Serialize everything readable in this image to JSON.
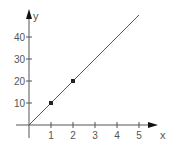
{
  "chart_data": {
    "type": "line",
    "title": "",
    "xlabel": "x",
    "ylabel": "y",
    "xlim": [
      0,
      5.4
    ],
    "ylim": [
      0,
      50
    ],
    "x_ticks": [
      1,
      2,
      3,
      4,
      5
    ],
    "y_ticks": [
      10,
      20,
      30,
      40
    ],
    "x_tick_labels": [
      "1",
      "2",
      "3",
      "4",
      "5"
    ],
    "y_tick_labels": [
      "10",
      "20",
      "30",
      "40"
    ],
    "grid": false,
    "legend": null,
    "series": [
      {
        "name": "line",
        "kind": "line",
        "x": [
          0,
          5
        ],
        "y": [
          0,
          50
        ],
        "color": "#555555"
      },
      {
        "name": "points",
        "kind": "scatter",
        "x": [
          1,
          2
        ],
        "y": [
          10,
          20
        ],
        "color": "#222222"
      }
    ]
  },
  "axes": {
    "x_label": "x",
    "y_label": "y"
  }
}
